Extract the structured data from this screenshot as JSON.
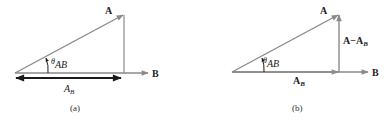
{
  "colors": {
    "vector_gray": "#8a8a8a",
    "projection_dark": "#1a1a1a",
    "text": "#222222"
  },
  "panel_a": {
    "caption": "(a)",
    "vector_A_label": "A",
    "vector_B_label": "B",
    "angle_symbol": "θ",
    "angle_subscript": "AB",
    "projection_main": "A",
    "projection_sub": "B"
  },
  "panel_b": {
    "caption": "(b)",
    "vector_A_label": "A",
    "vector_B_label": "B",
    "angle_symbol": "θ",
    "angle_subscript": "AB",
    "projection_main": "A",
    "projection_sub": "B",
    "perpendicular_main": "A−A",
    "perpendicular_sub": "B"
  }
}
